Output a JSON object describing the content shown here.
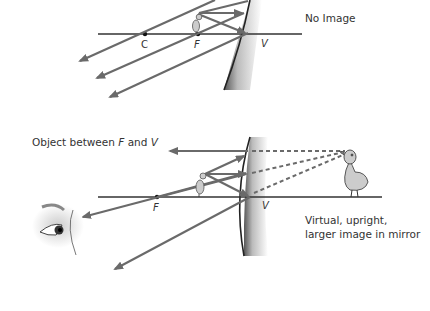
{
  "top_diagram": {
    "caption": "No Image",
    "points": {
      "C": "C",
      "F": "F",
      "V": "V"
    }
  },
  "bottom_diagram": {
    "caption": "Object between F and V",
    "caption_parts": [
      "Object between ",
      "F",
      " and ",
      "V"
    ],
    "points": {
      "F": "F",
      "V": "V"
    },
    "result_line1": "Virtual, upright,",
    "result_line2": "larger image in mirror"
  },
  "colors": {
    "ray": "#6a6a6a",
    "axis": "#333333",
    "mirror_edge": "#222222"
  }
}
